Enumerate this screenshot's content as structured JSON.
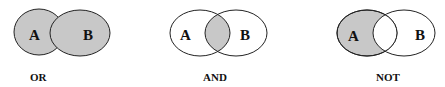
{
  "diagrams": [
    {
      "operator": "OR",
      "set_a": "A",
      "set_b": "B",
      "shaded_region": "A ∪ B"
    },
    {
      "operator": "AND",
      "set_a": "A",
      "set_b": "B",
      "shaded_region": "A ∩ B"
    },
    {
      "operator": "NOT",
      "set_a": "A",
      "set_b": "B",
      "shaded_region": "A − B"
    }
  ],
  "colors": {
    "shade": "#c8c8c8",
    "stroke": "#222222",
    "background": "#ffffff"
  }
}
